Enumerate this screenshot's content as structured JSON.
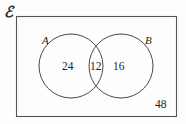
{
  "diagram": {
    "type": "venn-two-set",
    "title_symbol": "ℰ",
    "universal_set_label": "ℰ",
    "sets": [
      {
        "id": "A",
        "label": "A",
        "only_count": "24"
      },
      {
        "id": "B",
        "label": "B",
        "only_count": "16"
      }
    ],
    "intersection_count": "12",
    "outside_count": "48",
    "counts": {
      "a_only": "24",
      "intersection": "12",
      "b_only": "16",
      "outside": "48"
    },
    "colors": {
      "stroke": "#4a4a4a",
      "rect_stroke": "#555555",
      "text": "#1c1c1c",
      "background": "#fdfdfd"
    },
    "geometry": {
      "rect": {
        "x": 16,
        "y": 16,
        "width": 161,
        "height": 101
      },
      "circle_a": {
        "cx": 71,
        "cy": 66,
        "r": 32
      },
      "circle_b": {
        "cx": 121,
        "cy": 66,
        "r": 32
      }
    }
  }
}
